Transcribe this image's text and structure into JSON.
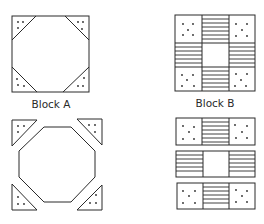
{
  "figure": {
    "labels": {
      "block_a": "Block A",
      "block_b": "Block B"
    },
    "colors": {
      "line": "#2a2a2a",
      "background": "#ffffff"
    },
    "panels": [
      {
        "id": "block-a-assembled",
        "description": "Square block with four dotted corner triangles forming an octagon center"
      },
      {
        "id": "block-b-assembled",
        "description": "Nine-patch block: dotted corners, striped edges, plain center"
      },
      {
        "id": "block-a-exploded",
        "description": "Octagon with four separated dotted corner triangles"
      },
      {
        "id": "block-b-exploded",
        "description": "Three horizontal rows of the nine-patch separated"
      }
    ]
  }
}
